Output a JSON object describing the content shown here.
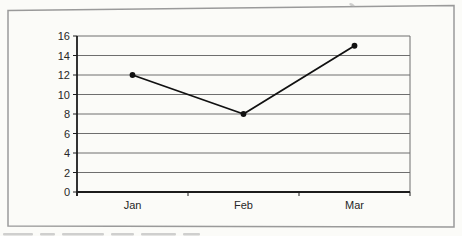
{
  "page": {
    "background": "#fbfbf8",
    "title": ""
  },
  "chart_data": {
    "type": "line",
    "title": "",
    "xlabel": "",
    "ylabel": "",
    "categories": [
      "Jan",
      "Feb",
      "Mar"
    ],
    "series": [
      {
        "name": "",
        "values": [
          12,
          8,
          15
        ]
      }
    ],
    "ylim": [
      0,
      16
    ],
    "y_ticks": [
      0,
      2,
      4,
      6,
      8,
      10,
      12,
      14,
      16
    ],
    "grid": true,
    "legend": false,
    "marker": "filled-circle",
    "colors": {
      "line": "#111111",
      "marker": "#111111",
      "grid": "#6e6e6e",
      "axis": "#1c1c1c",
      "plot_right_border": "#6e6e6e",
      "frame_border": "#9a9a9a",
      "text": "#272727",
      "background": "#fbfbf8"
    }
  }
}
